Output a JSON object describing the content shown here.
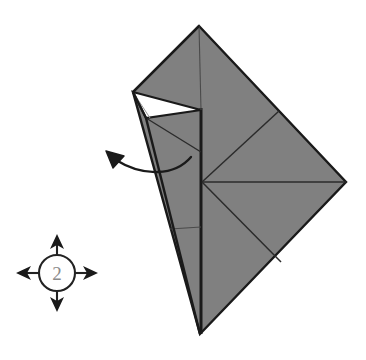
{
  "figure": {
    "type": "origami-instruction-diagram",
    "background_color": "#ffffff"
  },
  "colors": {
    "paper_front": "#808080",
    "paper_back": "#ffffff",
    "outline": "#1a1a1a",
    "crease_line": "#3c3c3c",
    "arrow": "#1a1a1a",
    "symbol_stroke": "#222222",
    "step_number_fill": "#8a8a8a"
  },
  "step_symbol": {
    "name": "repeat-steps-symbol",
    "number_label": "2",
    "description": "Circled number with four arrows indicating repeat in all directions",
    "center_x": 57,
    "center_y": 273,
    "circle_radius": 18,
    "arrows": [
      {
        "name": "arrow-up",
        "direction": "up",
        "tip_x": 57,
        "tip_y": 236
      },
      {
        "name": "arrow-down",
        "direction": "down",
        "tip_x": 57,
        "tip_y": 311
      },
      {
        "name": "arrow-left",
        "direction": "left",
        "tip_x": 18,
        "tip_y": 273
      },
      {
        "name": "arrow-right",
        "direction": "right",
        "tip_x": 96,
        "tip_y": 273
      }
    ]
  },
  "fold_arrow": {
    "name": "unfold-arrow",
    "description": "Curved arrow pointing up-left indicating the flap is pulled out",
    "start_x": 191,
    "start_y": 157,
    "end_x": 108,
    "end_y": 154,
    "arrowhead_angle_deg": 200
  },
  "model": {
    "name": "folded-paper-model",
    "apex_top": {
      "x": 199,
      "y": 26
    },
    "vertex_right": {
      "x": 346,
      "y": 182
    },
    "vertex_bottom": {
      "x": 200,
      "y": 334
    },
    "vertex_left": {
      "x": 133,
      "y": 92
    },
    "center_node": {
      "x": 202,
      "y": 182
    },
    "white_flap_points": "133,92 201,110 146,118",
    "gray_body_points": "199,26 346,182 200,334 133,92",
    "spine_x": 201,
    "crease_lines": [
      {
        "name": "crease-spine-vertical",
        "points": "201,110 201,334"
      },
      {
        "name": "crease-center-to-upper-right",
        "points": "202,182 279,111"
      },
      {
        "name": "crease-center-horizontal",
        "points": "202,182 346,182"
      },
      {
        "name": "crease-center-to-lower-right",
        "points": "202,182 281,262"
      },
      {
        "name": "crease-flap-upper",
        "points": "146,118 201,153"
      },
      {
        "name": "crease-left-lower",
        "points": "170,228 201,228"
      },
      {
        "name": "crease-white-thin",
        "points": "133,92 150,118"
      },
      {
        "name": "crease-apex-down",
        "points": "199,26 201,110"
      }
    ]
  }
}
